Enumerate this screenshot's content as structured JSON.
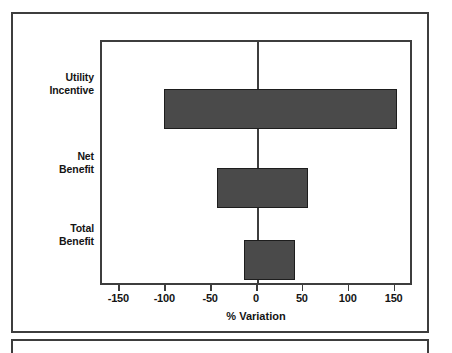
{
  "chart_data": {
    "type": "bar",
    "orientation": "horizontal",
    "subtype": "tornado",
    "title": "",
    "xlabel": "% Variation",
    "ylabel": "",
    "xlim": [
      -170,
      170
    ],
    "xticks": [
      -150,
      -100,
      -50,
      0,
      50,
      100,
      150
    ],
    "xtick_labels": [
      "-150",
      "-100",
      "-50",
      "0",
      "50",
      "100",
      "150"
    ],
    "categories": [
      "Utility Incentive",
      "Net Benefit",
      "Total Benefit"
    ],
    "category_labels_wrapped": [
      [
        "Utility",
        "Incentive"
      ],
      [
        "Net",
        "Benefit"
      ],
      [
        "Total",
        "Benefit"
      ]
    ],
    "bars": [
      {
        "category": "Utility Incentive",
        "low": -102,
        "high": 151
      },
      {
        "category": "Net Benefit",
        "low": -45,
        "high": 54
      },
      {
        "category": "Total Benefit",
        "low": -15,
        "high": 40
      }
    ],
    "grid": false,
    "legend": null,
    "bar_color": "#4a4a4a",
    "bar_edge_color": "#1d1d1d",
    "axis_color": "#3d3d3d",
    "zero_reference": 0
  }
}
